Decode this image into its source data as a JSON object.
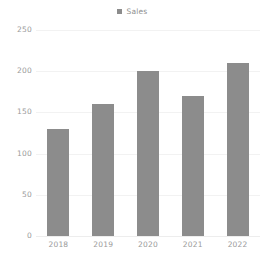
{
  "chart_data": {
    "type": "bar",
    "title": "",
    "subtitle": "",
    "xlabel": "",
    "ylabel": "",
    "categories": [
      "2018",
      "2019",
      "2020",
      "2021",
      "2022"
    ],
    "series": [
      {
        "name": "Sales",
        "values": [
          130,
          160,
          200,
          170,
          210
        ],
        "color": "#8c8c8c"
      }
    ],
    "values": [
      130,
      160,
      200,
      170,
      210
    ],
    "ylim": [
      0,
      250
    ],
    "ytick_values": [
      250,
      200,
      150,
      100,
      50,
      0
    ],
    "ytick_labels": [
      "250",
      "200",
      "150",
      "100",
      "50",
      "0"
    ],
    "grid": true,
    "grid_color": "#f2f2f2",
    "legend_position": "top-center",
    "legend": [
      {
        "label": "Sales",
        "marker": "square-marker",
        "color": "#8c8c8c"
      }
    ],
    "background_color": "#ffffff",
    "tick_label_color": "#9a9a9a"
  }
}
